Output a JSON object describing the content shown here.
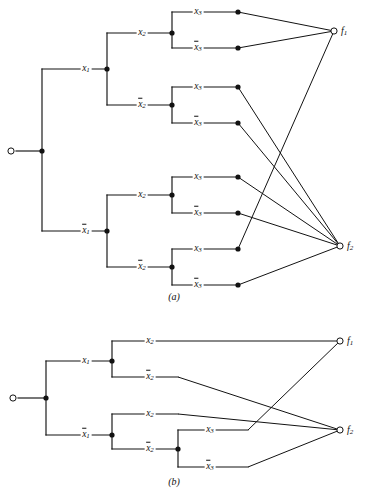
{
  "figure": {
    "panels": [
      {
        "id": "a",
        "caption": "(a)",
        "caption_x": 174,
        "caption_y": 296,
        "root": {
          "name": "root-terminal",
          "x": 11,
          "y": 151
        },
        "outputs": [
          {
            "name": "f1",
            "label": "f",
            "sub": "1",
            "x": 334,
            "y": 31,
            "label_x": 342,
            "label_y": 31
          },
          {
            "name": "f2",
            "label": "f",
            "sub": "2",
            "x": 340,
            "y": 246,
            "label_x": 348,
            "label_y": 246
          }
        ],
        "level1_labels": [
          {
            "text": "x",
            "sub": "1",
            "bar": false,
            "x": 86,
            "y": 69
          },
          {
            "text": "x",
            "sub": "1",
            "bar": true,
            "x": 86,
            "y": 231
          }
        ],
        "level2_labels": [
          {
            "text": "x",
            "sub": "2",
            "bar": false,
            "x": 142,
            "y": 33
          },
          {
            "text": "x",
            "sub": "2",
            "bar": true,
            "x": 142,
            "y": 105
          },
          {
            "text": "x",
            "sub": "2",
            "bar": false,
            "x": 142,
            "y": 195
          },
          {
            "text": "x",
            "sub": "2",
            "bar": true,
            "x": 142,
            "y": 267
          }
        ],
        "level3_labels": [
          {
            "text": "x",
            "sub": "3",
            "bar": false,
            "x": 198,
            "y": 12
          },
          {
            "text": "x",
            "sub": "3",
            "bar": true,
            "x": 198,
            "y": 48
          },
          {
            "text": "x",
            "sub": "3",
            "bar": false,
            "x": 198,
            "y": 87
          },
          {
            "text": "x",
            "sub": "3",
            "bar": true,
            "x": 198,
            "y": 123
          },
          {
            "text": "x",
            "sub": "3",
            "bar": false,
            "x": 198,
            "y": 177
          },
          {
            "text": "x",
            "sub": "3",
            "bar": true,
            "x": 198,
            "y": 213
          },
          {
            "text": "x",
            "sub": "3",
            "bar": false,
            "x": 198,
            "y": 249
          },
          {
            "text": "x",
            "sub": "3",
            "bar": true,
            "x": 198,
            "y": 285
          }
        ],
        "terminal_dots": [
          {
            "x": 238,
            "y": 12,
            "to": "f1"
          },
          {
            "x": 238,
            "y": 48,
            "to": "f1"
          },
          {
            "x": 238,
            "y": 87,
            "to": "f2"
          },
          {
            "x": 238,
            "y": 123,
            "to": "f2"
          },
          {
            "x": 238,
            "y": 177,
            "to": "f2"
          },
          {
            "x": 238,
            "y": 213,
            "to": "f2"
          },
          {
            "x": 238,
            "y": 249,
            "to": "f1"
          },
          {
            "x": 238,
            "y": 285,
            "to": "f2"
          }
        ],
        "junction_dots": [
          {
            "name": "root-junction",
            "x": 42,
            "y": 151
          },
          {
            "name": "x1-junction",
            "x": 107,
            "y": 69
          },
          {
            "name": "x1bar-junction",
            "x": 107,
            "y": 231
          },
          {
            "name": "x2-a-junction",
            "x": 172,
            "y": 33
          },
          {
            "name": "x2-b-junction",
            "x": 172,
            "y": 105
          },
          {
            "name": "x2-c-junction",
            "x": 172,
            "y": 195
          },
          {
            "name": "x2-d-junction",
            "x": 172,
            "y": 267
          }
        ]
      },
      {
        "id": "b",
        "caption": "(b)",
        "caption_x": 174,
        "caption_y": 481,
        "root": {
          "name": "root-terminal",
          "x": 13,
          "y": 398
        },
        "outputs": [
          {
            "name": "f1",
            "label": "f",
            "sub": "1",
            "x": 340,
            "y": 341,
            "label_x": 348,
            "label_y": 341
          },
          {
            "name": "f2",
            "label": "f",
            "sub": "2",
            "x": 340,
            "y": 430,
            "label_x": 348,
            "label_y": 430
          }
        ],
        "level1_labels": [
          {
            "text": "x",
            "sub": "1",
            "bar": false,
            "x": 86,
            "y": 361
          },
          {
            "text": "x",
            "sub": "1",
            "bar": true,
            "x": 86,
            "y": 435
          }
        ],
        "level2_labels": [
          {
            "text": "x",
            "sub": "2",
            "bar": false,
            "x": 150,
            "y": 341
          },
          {
            "text": "x",
            "sub": "2",
            "bar": true,
            "x": 150,
            "y": 377
          },
          {
            "text": "x",
            "sub": "2",
            "bar": false,
            "x": 150,
            "y": 414
          },
          {
            "text": "x",
            "sub": "2",
            "bar": true,
            "x": 150,
            "y": 449
          }
        ],
        "level3_labels": [
          {
            "text": "x",
            "sub": "3",
            "bar": false,
            "x": 210,
            "y": 430
          },
          {
            "text": "x",
            "sub": "3",
            "bar": true,
            "x": 210,
            "y": 467
          }
        ],
        "junction_dots": [
          {
            "name": "root-junction",
            "x": 46,
            "y": 398
          },
          {
            "name": "x1-junction",
            "x": 112,
            "y": 361
          },
          {
            "name": "x1bar-junction",
            "x": 112,
            "y": 435
          },
          {
            "name": "x2bar-junction",
            "x": 178,
            "y": 449
          }
        ]
      }
    ]
  }
}
